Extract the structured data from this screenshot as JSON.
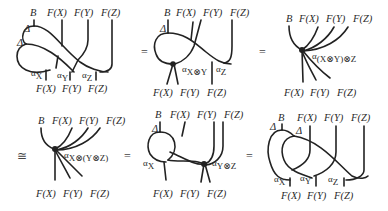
{
  "figure": {
    "relations": [
      "=",
      "=",
      "≅",
      "=",
      "="
    ],
    "panels": [
      {
        "id": "p1",
        "top_labels": [
          "B",
          "F(X)",
          "F(Y)",
          "F(Z)"
        ],
        "bottom_labels": [
          "F(X)",
          "F(Y)",
          "F(Z)"
        ],
        "node_labels": [
          "Δ",
          "Δ",
          "αX",
          "αY",
          "αZ"
        ]
      },
      {
        "id": "p2",
        "top_labels": [
          "B",
          "F(X)",
          "F(Y)",
          "F(Z)"
        ],
        "bottom_labels": [
          "F(X)",
          "F(Y)",
          "F(Z)"
        ],
        "node_labels": [
          "Δ",
          "αX⊗Y",
          "αZ"
        ]
      },
      {
        "id": "p3",
        "top_labels": [
          "B",
          "F(X)",
          "F(Y)",
          "F(Z)"
        ],
        "bottom_labels": [
          "F(X)",
          "F(Y)",
          "F(Z)"
        ],
        "node_labels": [
          "α(X⊗Y)⊗Z"
        ]
      },
      {
        "id": "p4",
        "top_labels": [
          "B",
          "F(X)",
          "F(Y)",
          "F(Z)"
        ],
        "bottom_labels": [
          "F(X)",
          "F(Y)",
          "F(Z)"
        ],
        "node_labels": [
          "αX⊗(Y⊗Z)"
        ]
      },
      {
        "id": "p5",
        "top_labels": [
          "B",
          "F(X)",
          "F(Y)",
          "F(Z)"
        ],
        "bottom_labels": [
          "F(X)",
          "F(Y)",
          "F(Z)"
        ],
        "node_labels": [
          "Δ",
          "αX",
          "αY⊗Z"
        ]
      },
      {
        "id": "p6",
        "top_labels": [
          "B",
          "F(X)",
          "F(Y)",
          "F(Z)"
        ],
        "bottom_labels": [
          "F(X)",
          "F(Y)",
          "F(Z)"
        ],
        "node_labels": [
          "Δ",
          "Δ",
          "αX",
          "αY",
          "αZ"
        ]
      }
    ],
    "sub": {
      "x": "X",
      "y": "Y",
      "z": "Z",
      "xy": "X⊗Y",
      "yz": "Y⊗Z",
      "xy_z": "(X⊗Y)⊗Z",
      "x_yz": "X⊗(Y⊗Z)"
    },
    "symbols": {
      "alpha": "α",
      "delta": "Δ"
    }
  }
}
